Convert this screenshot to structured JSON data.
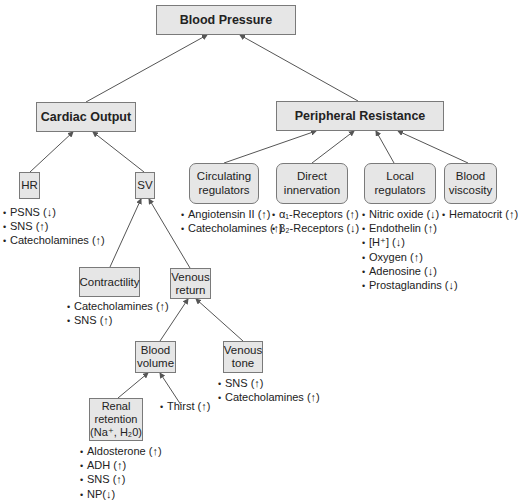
{
  "diagram": {
    "title": "Blood Pressure",
    "colors": {
      "box_fill": "#e6e6e6",
      "box_border": "#7a7a7a",
      "line": "#555555",
      "text": "#222222"
    },
    "nodes": {
      "blood_pressure": "Blood Pressure",
      "cardiac_output": "Cardiac Output",
      "peripheral_resistance": "Peripheral Resistance",
      "hr": "HR",
      "sv": "SV",
      "circulating_regulators": "Circulating\nregulators",
      "direct_innervation": "Direct\ninnervation",
      "local_regulators": "Local\nregulators",
      "blood_viscosity": "Blood\nviscosity",
      "contractility": "Contractility",
      "venous_return": "Venous\nreturn",
      "blood_volume": "Blood\nvolume",
      "venous_tone": "Venous\ntone",
      "renal_retention": "Renal\nretention\n(Na⁺, H₂0)"
    },
    "factors": {
      "hr": [
        "PSNS (↓)",
        "SNS (↑)",
        "Catecholamines (↑)"
      ],
      "circulating_regulators": [
        "Angiotensin II (↑)",
        "Catecholamines (↑)"
      ],
      "direct_innervation": [
        "α₁-Receptors (↑)",
        "β₂-Receptors (↓)"
      ],
      "local_regulators": [
        "Nitric oxide (↓)",
        "Endothelin (↑)",
        "[H⁺] (↓)",
        "Oxygen (↑)",
        "Adenosine (↓)",
        "Prostaglandins (↓)"
      ],
      "blood_viscosity": [
        "Hematocrit (↑)"
      ],
      "contractility": [
        "Catecholamines (↑)",
        "SNS (↑)"
      ],
      "venous_tone": [
        "SNS (↑)",
        "Catecholamines (↑)"
      ],
      "thirst": "Thirst (↑)",
      "renal_retention": [
        "Aldosterone (↑)",
        "ADH (↑)",
        "SNS (↑)",
        "NP(↓)"
      ]
    }
  }
}
